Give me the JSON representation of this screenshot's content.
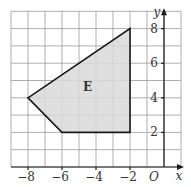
{
  "diagram": {
    "type": "coordinate-grid-polygon",
    "x_axis": {
      "label": "x",
      "origin_label": "O",
      "range": [
        -9,
        1
      ],
      "ticks": [
        {
          "value": -8,
          "label": "−8"
        },
        {
          "value": -6,
          "label": "−6"
        },
        {
          "value": -4,
          "label": "−4"
        },
        {
          "value": -2,
          "label": "−2"
        }
      ]
    },
    "y_axis": {
      "label": "y",
      "range": [
        0,
        9
      ],
      "ticks": [
        {
          "value": 2,
          "label": "2"
        },
        {
          "value": 4,
          "label": "4"
        },
        {
          "value": 6,
          "label": "6"
        },
        {
          "value": 8,
          "label": "8"
        }
      ]
    },
    "shape": {
      "label": "E",
      "vertices": [
        [
          -8,
          4
        ],
        [
          -2,
          8
        ],
        [
          -2,
          2
        ],
        [
          -6,
          2
        ]
      ],
      "fill_color": "#d9d9d9",
      "stroke_color": "#1a1a1a"
    },
    "grid_color": "#9a9a9a"
  }
}
